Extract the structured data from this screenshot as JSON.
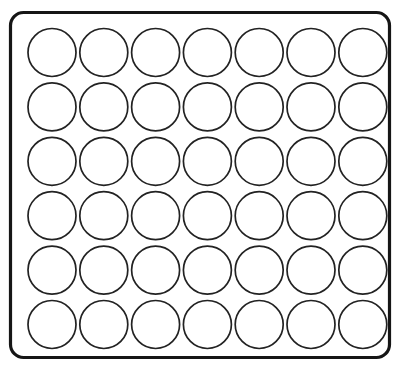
{
  "canvas": {
    "width": 407,
    "height": 371,
    "background_color": "#ffffff"
  },
  "diagram": {
    "style": "line-art-outline",
    "fill": "none",
    "stroke_color": "#1a1a1a"
  },
  "tray": {
    "name": "tray-outline",
    "shape": "rounded-rectangle",
    "x": 10.5,
    "y": 12.5,
    "width": 379,
    "height": 345,
    "corner_radius": 13,
    "stroke_width": 3.2,
    "stroke_color": "#161616",
    "fill_color": "none"
  },
  "grid": {
    "name": "circle-grid",
    "columns": 7,
    "rows": 6,
    "total_circles": 42,
    "circle_diameter": 48,
    "circle_radius": 24,
    "circle_stroke_width": 1.7,
    "circle_stroke_color": "#222222",
    "circle_fill_color": "#ffffff",
    "first_center_x": 52,
    "first_center_y": 52.5,
    "pitch_x": 51.8,
    "pitch_y": 54.4,
    "column_centers_x": [
      52,
      103.8,
      155.6,
      207.4,
      259.2,
      311,
      362.8
    ],
    "row_centers_y": [
      52.5,
      106.9,
      161.3,
      215.7,
      270.1,
      324.5
    ]
  }
}
